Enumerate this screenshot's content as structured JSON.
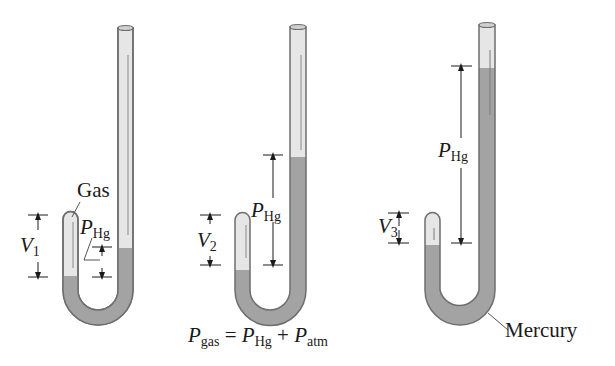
{
  "figure": {
    "type": "manometer-diagram",
    "colors": {
      "tube_glass": "#e6e6e6",
      "tube_outline": "#6e6e6e",
      "mercury": "#a3a3a3",
      "mercury_dark": "#8e8e8e",
      "text": "#1a1a1a",
      "background": "#ffffff"
    },
    "panels": [
      {
        "id": "panel-1",
        "volume_label": {
          "var": "V",
          "sub": "1"
        },
        "pressure_label": {
          "var": "P",
          "sub": "Hg"
        },
        "gas_label": "Gas"
      },
      {
        "id": "panel-2",
        "volume_label": {
          "var": "V",
          "sub": "2"
        },
        "pressure_label": {
          "var": "P",
          "sub": "Hg"
        },
        "equation": {
          "lhs_var": "P",
          "lhs_sub": "gas",
          "equals": "=",
          "t1_var": "P",
          "t1_sub": "Hg",
          "plus": "+",
          "t2_var": "P",
          "t2_sub": "atm"
        }
      },
      {
        "id": "panel-3",
        "volume_label": {
          "var": "V",
          "sub": "3"
        },
        "pressure_label": {
          "var": "P",
          "sub": "Hg"
        },
        "mercury_label": "Mercury"
      }
    ]
  }
}
